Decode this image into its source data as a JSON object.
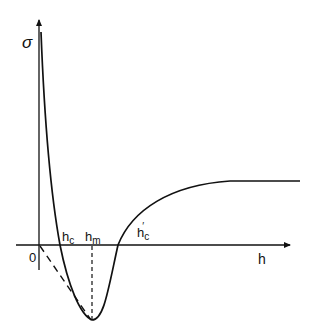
{
  "diagram": {
    "type": "curve-sketch",
    "y_axis_label": "σ",
    "x_axis_label": "h",
    "origin_label": "0",
    "markers": [
      {
        "name": "h_c",
        "base": "h",
        "sub": "c",
        "prime": ""
      },
      {
        "name": "h_m",
        "base": "h",
        "sub": "m",
        "prime": ""
      },
      {
        "name": "h'_c",
        "base": "h",
        "sub": "c",
        "prime": "′"
      }
    ]
  }
}
